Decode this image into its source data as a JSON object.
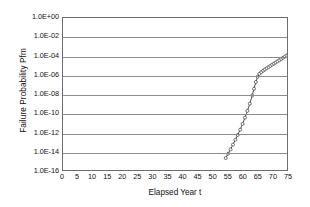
{
  "chart_data": {
    "type": "line",
    "title": "",
    "xlabel": "Elapsed Year t",
    "ylabel": "Failure Probability Pfm",
    "xlim": [
      0,
      75
    ],
    "ylim_exp": [
      -16,
      0
    ],
    "yscale": "log",
    "grid": "horizontal",
    "legend": "none",
    "line_color": "#3a3a3a",
    "marker": "open-circle",
    "xticks": [
      0,
      5,
      10,
      15,
      20,
      25,
      30,
      35,
      40,
      45,
      50,
      55,
      60,
      65,
      70,
      75
    ],
    "ytick_labels": [
      "1.0E+00",
      "1.0E-02",
      "1.0E-04",
      "1.0E-06",
      "1.0E-08",
      "1.0E-10",
      "1.0E-12",
      "1.0E-14",
      "1.0E-16"
    ],
    "ytick_exponents": [
      0,
      -2,
      -4,
      -6,
      -8,
      -10,
      -12,
      -14,
      -16
    ],
    "series": [
      {
        "name": "Failure Probability Pfm",
        "x": [
          54.0,
          54.8,
          55.6,
          56.4,
          57.2,
          58.0,
          58.8,
          59.6,
          60.4,
          61.2,
          62.0,
          62.8,
          63.4,
          64.0,
          64.6,
          65.2,
          65.8,
          66.4,
          67.0,
          67.6,
          68.2,
          68.8,
          69.4,
          70.0,
          70.6,
          71.2,
          71.8,
          72.4,
          73.0,
          73.6,
          74.2,
          74.8,
          75.0
        ],
        "y_exponent": [
          -14.55,
          -14.1,
          -13.65,
          -13.15,
          -12.65,
          -12.15,
          -11.6,
          -11.0,
          -10.35,
          -9.65,
          -8.9,
          -8.05,
          -7.35,
          -6.65,
          -6.1,
          -5.8,
          -5.62,
          -5.48,
          -5.35,
          -5.22,
          -5.1,
          -4.98,
          -4.86,
          -4.74,
          -4.62,
          -4.5,
          -4.38,
          -4.26,
          -4.14,
          -4.02,
          -3.9,
          -3.8,
          -3.76
        ]
      }
    ]
  }
}
